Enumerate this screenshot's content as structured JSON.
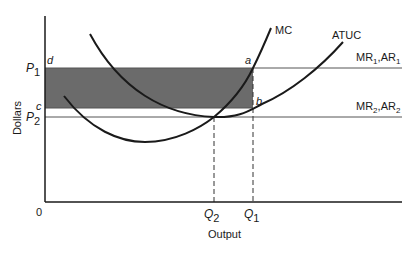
{
  "diagram": {
    "type": "economics-cost-revenue-diagram",
    "y_axis_label": "Dollars",
    "x_axis_label": "Output",
    "origin_label": "0",
    "price_labels": {
      "p1": {
        "letter": "P",
        "sub": "1"
      },
      "p2": {
        "letter": "P",
        "sub": "2"
      }
    },
    "quantity_labels": {
      "q1": {
        "letter": "Q",
        "sub": "1"
      },
      "q2": {
        "letter": "Q",
        "sub": "2"
      }
    },
    "point_labels": {
      "a": "a",
      "b": "b",
      "c": "c",
      "d": "d"
    },
    "curves": {
      "mc": "MC",
      "atuc": "ATUC"
    },
    "demand_lines": {
      "line1": {
        "mr": "MR",
        "mr_sub": "1",
        "sep": ",",
        "ar": "AR",
        "ar_sub": "1"
      },
      "line2": {
        "mr": "MR",
        "mr_sub": "2",
        "sep": ",",
        "ar": "AR",
        "ar_sub": "2"
      }
    },
    "shaded_region": "profit rectangle abcd",
    "colors": {
      "line": "#1a1a1a",
      "shade": "#6b6b6b",
      "thin_line": "#555555"
    }
  }
}
